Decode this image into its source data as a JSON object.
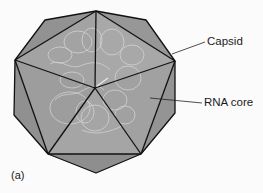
{
  "diagram": {
    "labels": {
      "capsid": "Capsid",
      "rna_core": "RNA core",
      "panel": "(a)"
    },
    "colors": {
      "background": "#fbfbfb",
      "face_light": "#a6a6a6",
      "face_mid": "#9c9c9c",
      "face_dark": "#8f8f8f",
      "edge": "#111111",
      "rna_strand": "#d6d6d6",
      "leader_line": "#222222"
    }
  }
}
